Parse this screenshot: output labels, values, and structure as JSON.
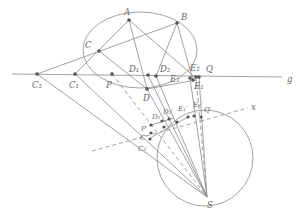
{
  "diagram": {
    "labels": {
      "A": "A",
      "B": "B",
      "C": "C",
      "D": "D",
      "D1": "D₁",
      "D2": "D₂",
      "E1": "E₁",
      "E2": "E₂",
      "Q": "Q",
      "g": "g",
      "C1": "C₁",
      "C2": "C₂",
      "P": "P",
      "x": "x",
      "Pp": "P′",
      "Cp": "C′",
      "C2p": "C₂′",
      "D1p": "D₁′",
      "D2p": "D₂′",
      "E1p": "E₁′",
      "E2p": "E₂′",
      "Qp": "Q′",
      "S": "S"
    },
    "colors": {
      "line": "#8a8a8a",
      "point": "#555555",
      "label": "#666666"
    }
  }
}
